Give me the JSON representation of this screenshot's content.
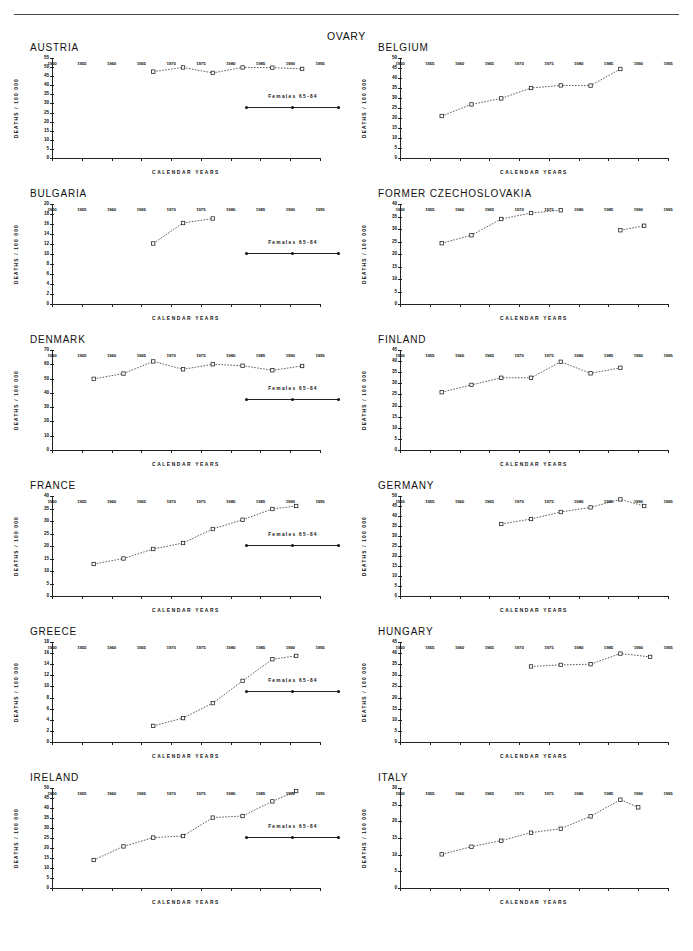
{
  "document": {
    "figure_title": "OVARY",
    "axis_labels": {
      "y": "DEATHS / 100 000",
      "x": "CALENDAR YEARS"
    },
    "legend_label": "Females 65-84"
  },
  "chart_data": [
    {
      "type": "line",
      "title": "AUSTRIA",
      "xlabel": "CALENDAR YEARS",
      "ylabel": "DEATHS / 100 000",
      "xlim": [
        1950,
        1995
      ],
      "ylim": [
        0,
        55
      ],
      "xticks": [
        1950,
        1955,
        1960,
        1965,
        1970,
        1975,
        1980,
        1985,
        1990,
        1995
      ],
      "yticks": [
        0,
        5,
        10,
        15,
        20,
        25,
        30,
        35,
        40,
        45,
        50,
        55
      ],
      "grid": false,
      "series": [
        {
          "name": "Females 65-84",
          "x": [
            1967,
            1972,
            1977,
            1982,
            1987,
            1992
          ],
          "values": [
            47.5,
            49.8,
            46.8,
            49.8,
            49.7,
            49.0
          ]
        }
      ]
    },
    {
      "type": "line",
      "title": "BELGIUM",
      "xlabel": "CALENDAR YEARS",
      "ylabel": "DEATHS / 100 000",
      "xlim": [
        1950,
        1995
      ],
      "ylim": [
        0,
        50
      ],
      "xticks": [
        1950,
        1955,
        1960,
        1965,
        1970,
        1975,
        1980,
        1985,
        1990,
        1995
      ],
      "yticks": [
        0,
        5,
        10,
        15,
        20,
        25,
        30,
        35,
        40,
        45,
        50
      ],
      "grid": false,
      "series": [
        {
          "name": "Females 65-84",
          "x": [
            1957,
            1962,
            1967,
            1972,
            1977,
            1982,
            1987
          ],
          "values": [
            21.0,
            26.8,
            29.8,
            35.0,
            36.3,
            36.2,
            44.5
          ]
        }
      ]
    },
    {
      "type": "line",
      "title": "BULGARIA",
      "xlabel": "CALENDAR YEARS",
      "ylabel": "DEATHS / 100 000",
      "xlim": [
        1950,
        1995
      ],
      "ylim": [
        0,
        20
      ],
      "xticks": [
        1950,
        1955,
        1960,
        1965,
        1970,
        1975,
        1980,
        1985,
        1990,
        1995
      ],
      "yticks": [
        0,
        2,
        4,
        6,
        8,
        10,
        12,
        14,
        16,
        18,
        20
      ],
      "grid": false,
      "series": [
        {
          "name": "Females 65-84",
          "x": [
            1967,
            1972,
            1977
          ],
          "values": [
            12.1,
            16.2,
            17.1
          ]
        }
      ]
    },
    {
      "type": "line",
      "title": "FORMER CZECHOSLOVAKIA",
      "xlabel": "CALENDAR YEARS",
      "ylabel": "DEATHS / 100 000",
      "xlim": [
        1950,
        1995
      ],
      "ylim": [
        0,
        40
      ],
      "xticks": [
        1950,
        1955,
        1960,
        1965,
        1970,
        1975,
        1980,
        1985,
        1990,
        1995
      ],
      "yticks": [
        0,
        5,
        10,
        15,
        20,
        25,
        30,
        35,
        40
      ],
      "grid": false,
      "series": [
        {
          "name": "Females 65-84",
          "x": [
            1957,
            1962,
            1967,
            1972,
            1977
          ],
          "values": [
            24.3,
            27.5,
            34.0,
            36.4,
            37.5
          ]
        },
        {
          "name": "Females 65-84",
          "x": [
            1987,
            1991
          ],
          "values": [
            29.5,
            31.3
          ]
        }
      ]
    },
    {
      "type": "line",
      "title": "DENMARK",
      "xlabel": "CALENDAR YEARS",
      "ylabel": "DEATHS / 100 000",
      "xlim": [
        1950,
        1995
      ],
      "ylim": [
        0,
        70
      ],
      "xticks": [
        1950,
        1955,
        1960,
        1965,
        1970,
        1975,
        1980,
        1985,
        1990,
        1995
      ],
      "yticks": [
        0,
        10,
        20,
        30,
        40,
        50,
        60,
        70
      ],
      "grid": false,
      "series": [
        {
          "name": "Females 65-84",
          "x": [
            1957,
            1962,
            1967,
            1972,
            1977,
            1982,
            1987,
            1992
          ],
          "values": [
            49.8,
            53.5,
            62.0,
            56.5,
            60.0,
            59.0,
            55.8,
            58.8
          ]
        }
      ]
    },
    {
      "type": "line",
      "title": "FINLAND",
      "xlabel": "CALENDAR YEARS",
      "ylabel": "DEATHS / 100 000",
      "xlim": [
        1950,
        1995
      ],
      "ylim": [
        0,
        45
      ],
      "xticks": [
        1950,
        1955,
        1960,
        1965,
        1970,
        1975,
        1980,
        1985,
        1990,
        1995
      ],
      "yticks": [
        0,
        5,
        10,
        15,
        20,
        25,
        30,
        35,
        40,
        45
      ],
      "grid": false,
      "series": [
        {
          "name": "Females 65-84",
          "x": [
            1957,
            1962,
            1967,
            1972,
            1977,
            1982,
            1987
          ],
          "values": [
            26.0,
            29.3,
            32.5,
            32.5,
            39.7,
            34.5,
            37.0
          ]
        }
      ]
    },
    {
      "type": "line",
      "title": "FRANCE",
      "xlabel": "CALENDAR YEARS",
      "ylabel": "DEATHS / 100 000",
      "xlim": [
        1950,
        1995
      ],
      "ylim": [
        0,
        40
      ],
      "xticks": [
        1950,
        1955,
        1960,
        1965,
        1970,
        1975,
        1980,
        1985,
        1990,
        1995
      ],
      "yticks": [
        0,
        5,
        10,
        15,
        20,
        25,
        30,
        35,
        40
      ],
      "grid": false,
      "series": [
        {
          "name": "Females 65-84",
          "x": [
            1957,
            1962,
            1967,
            1972,
            1977,
            1982,
            1987,
            1991
          ],
          "values": [
            12.8,
            15.0,
            18.8,
            21.2,
            26.8,
            30.5,
            34.8,
            36.0
          ]
        }
      ]
    },
    {
      "type": "line",
      "title": "GERMANY",
      "xlabel": "CALENDAR YEARS",
      "ylabel": "DEATHS / 100 000",
      "xlim": [
        1950,
        1995
      ],
      "ylim": [
        0,
        50
      ],
      "xticks": [
        1950,
        1955,
        1960,
        1965,
        1970,
        1975,
        1980,
        1985,
        1990,
        1995
      ],
      "yticks": [
        0,
        5,
        10,
        15,
        20,
        25,
        30,
        35,
        40,
        45,
        50
      ],
      "grid": false,
      "series": [
        {
          "name": "Females 65-84",
          "x": [
            1967,
            1972,
            1977,
            1982,
            1987,
            1991
          ],
          "values": [
            36.0,
            38.5,
            42.0,
            44.3,
            48.3,
            45.0
          ]
        }
      ]
    },
    {
      "type": "line",
      "title": "GREECE",
      "xlabel": "CALENDAR YEARS",
      "ylabel": "DEATHS / 100 000",
      "xlim": [
        1950,
        1995
      ],
      "ylim": [
        0,
        18
      ],
      "xticks": [
        1950,
        1955,
        1960,
        1965,
        1970,
        1975,
        1980,
        1985,
        1990,
        1995
      ],
      "yticks": [
        0,
        2,
        4,
        6,
        8,
        10,
        12,
        14,
        16,
        18
      ],
      "grid": false,
      "series": [
        {
          "name": "Females 65-84",
          "x": [
            1967,
            1972,
            1977,
            1982,
            1987,
            1991
          ],
          "values": [
            2.9,
            4.3,
            7.0,
            11.0,
            14.9,
            15.5
          ]
        }
      ]
    },
    {
      "type": "line",
      "title": "HUNGARY",
      "xlabel": "CALENDAR YEARS",
      "ylabel": "DEATHS / 100 000",
      "xlim": [
        1950,
        1995
      ],
      "ylim": [
        0,
        45
      ],
      "xticks": [
        1950,
        1955,
        1960,
        1965,
        1970,
        1975,
        1980,
        1985,
        1990,
        1995
      ],
      "yticks": [
        0,
        5,
        10,
        15,
        20,
        25,
        30,
        35,
        40,
        45
      ],
      "grid": false,
      "series": [
        {
          "name": "Females 65-84",
          "x": [
            1972,
            1977,
            1982,
            1987,
            1992
          ],
          "values": [
            34.0,
            34.7,
            35.0,
            39.8,
            38.3
          ]
        }
      ]
    },
    {
      "type": "line",
      "title": "IRELAND",
      "xlabel": "CALENDAR YEARS",
      "ylabel": "DEATHS / 100 000",
      "xlim": [
        1950,
        1995
      ],
      "ylim": [
        0,
        50
      ],
      "xticks": [
        1950,
        1955,
        1960,
        1965,
        1970,
        1975,
        1980,
        1985,
        1990,
        1995
      ],
      "yticks": [
        0,
        5,
        10,
        15,
        20,
        25,
        30,
        35,
        40,
        45,
        50
      ],
      "grid": false,
      "series": [
        {
          "name": "Females 65-84",
          "x": [
            1957,
            1962,
            1967,
            1972,
            1977,
            1982,
            1987,
            1991
          ],
          "values": [
            14.0,
            20.8,
            25.2,
            26.0,
            35.2,
            36.0,
            43.3,
            48.5
          ]
        }
      ]
    },
    {
      "type": "line",
      "title": "ITALY",
      "xlabel": "CALENDAR YEARS",
      "ylabel": "DEATHS / 100 000",
      "xlim": [
        1950,
        1995
      ],
      "ylim": [
        0,
        30
      ],
      "xticks": [
        1950,
        1955,
        1960,
        1965,
        1970,
        1975,
        1980,
        1985,
        1990,
        1995
      ],
      "yticks": [
        0,
        5,
        10,
        15,
        20,
        25,
        30
      ],
      "grid": false,
      "series": [
        {
          "name": "Females 65-84",
          "x": [
            1957,
            1962,
            1967,
            1972,
            1977,
            1982,
            1987,
            1990
          ],
          "values": [
            10.1,
            12.4,
            14.2,
            16.6,
            17.8,
            21.5,
            26.5,
            24.2
          ]
        }
      ]
    }
  ]
}
